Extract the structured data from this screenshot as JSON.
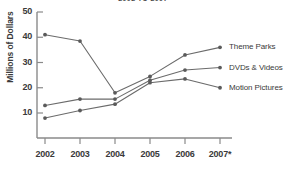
{
  "chart_data": {
    "type": "line",
    "title": "2002 TO 2007",
    "xlabel": "",
    "ylabel": "Millions of Dollars",
    "categories": [
      "2002",
      "2003",
      "2004",
      "2005",
      "2006",
      "2007*"
    ],
    "x_tick_labels": [
      "2002",
      "2003",
      "2004",
      "2005",
      "2006",
      "2007*"
    ],
    "y_tick_labels": [
      "10",
      "20",
      "30",
      "40",
      "50"
    ],
    "y_ticks": [
      10,
      20,
      30,
      40,
      50
    ],
    "ylim": [
      0,
      50
    ],
    "grid": false,
    "legend_position": "right-end-labels",
    "series": [
      {
        "name": "Theme Parks",
        "values": [
          41,
          38.5,
          18,
          24.5,
          33,
          36
        ],
        "color": "#6b6b6b"
      },
      {
        "name": "DVDs & Videos",
        "values": [
          13,
          15.5,
          15.5,
          23,
          27,
          28
        ],
        "color": "#6b6b6b"
      },
      {
        "name": "Motion Pictures",
        "values": [
          8,
          11,
          13.5,
          22,
          23.5,
          20
        ],
        "color": "#6b6b6b"
      }
    ],
    "colors": {
      "line": "#6b6b6b",
      "marker": "#5a5a5a",
      "axis": "#8a8a8a",
      "text": "#3a3a3a",
      "background": "#ffffff"
    }
  }
}
